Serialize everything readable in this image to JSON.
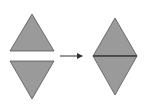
{
  "diagram": {
    "colors": {
      "fill": "#9a9a9a",
      "stroke": "#555555",
      "seam": "#222222",
      "arrow": "#333333",
      "background": "#ffffff"
    },
    "left_group": {
      "up_triangle": {
        "points": "32,14 10,51 54,51"
      },
      "down_triangle": {
        "points": "10,61 54,61 32,99"
      }
    },
    "arrow": {
      "x1": 60,
      "y1": 56,
      "x2": 82,
      "y2": 56,
      "direction": "right"
    },
    "right_group": {
      "diamond_top": {
        "points": "115,18 93,56 137,56"
      },
      "diamond_bottom": {
        "points": "93,56 137,56 115,95"
      },
      "seam": {
        "x1": 93,
        "y1": 56,
        "x2": 137,
        "y2": 56
      }
    }
  }
}
